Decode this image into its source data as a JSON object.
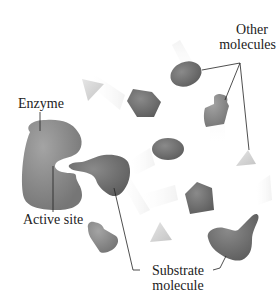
{
  "diagram": {
    "type": "enzyme-substrate-illustration",
    "labels": {
      "enzyme": "Enzyme",
      "active_site": "Active site",
      "other_molecules_line1": "Other",
      "other_molecules_line2": "molecules",
      "substrate_line1": "Substrate",
      "substrate_line2": "molecule"
    },
    "colors": {
      "background": "#ffffff",
      "molecule_dark": "#6e6e6e",
      "molecule_medium": "#8a8a8a",
      "molecule_light": "#d8d8d8",
      "enzyme_fill": "#8c8c8c",
      "leader_line": "#222222",
      "text": "#222222"
    },
    "elements": [
      {
        "id": "enzyme",
        "shape": "c-shape-with-pocket",
        "label": "Enzyme"
      },
      {
        "id": "substrate-1",
        "shape": "irregular-thumb",
        "near": "active site"
      },
      {
        "id": "substrate-2",
        "shape": "irregular-thumb",
        "position": "bottom-right"
      },
      {
        "id": "oval-1",
        "shape": "oval",
        "group": "other molecules"
      },
      {
        "id": "oval-2",
        "shape": "oval"
      },
      {
        "id": "bottle-1",
        "shape": "bottle",
        "group": "other molecules"
      },
      {
        "id": "bottle-2",
        "shape": "bottle"
      },
      {
        "id": "pentagon-1",
        "shape": "pentagon"
      },
      {
        "id": "pentagon-2",
        "shape": "pentagon"
      },
      {
        "id": "triangle-1",
        "shape": "triangle"
      },
      {
        "id": "triangle-2",
        "shape": "triangle",
        "group": "other molecules"
      },
      {
        "id": "triangle-3",
        "shape": "triangle"
      }
    ]
  }
}
